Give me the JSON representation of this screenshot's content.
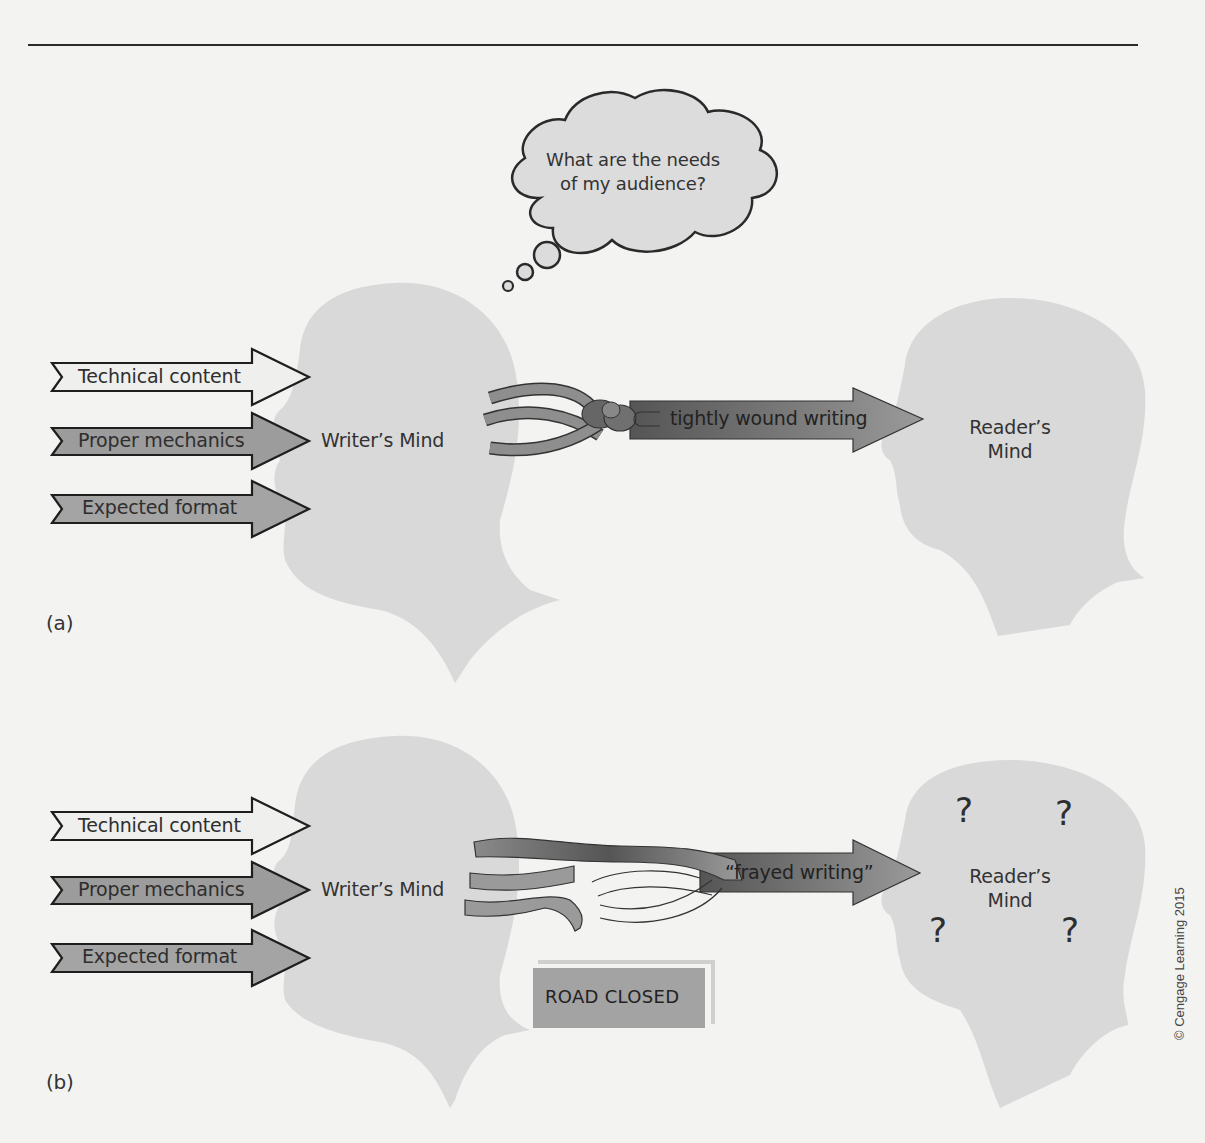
{
  "figure": {
    "thought_bubble": {
      "line1": "What are the needs",
      "line2": "of my audience?"
    },
    "panel_a": {
      "letter": "(a)",
      "inputs": [
        {
          "label": "Technical content",
          "fill": "#efefed"
        },
        {
          "label": "Proper mechanics",
          "fill": "#9c9c9c"
        },
        {
          "label": "Expected format",
          "fill": "#a4a4a4"
        }
      ],
      "writer_label": "Writer’s Mind",
      "output_arrow_label": "tightly wound writing",
      "reader_label_line1": "Reader’s",
      "reader_label_line2": "Mind"
    },
    "panel_b": {
      "letter": "(b)",
      "inputs": [
        {
          "label": "Technical content",
          "fill": "#efefed"
        },
        {
          "label": "Proper mechanics",
          "fill": "#9c9c9c"
        },
        {
          "label": "Expected format",
          "fill": "#a4a4a4"
        }
      ],
      "writer_label": "Writer’s Mind",
      "output_arrow_label": "“frayed writing”",
      "reader_label_line1": "Reader’s",
      "reader_label_line2": "Mind",
      "question_marks": [
        "?",
        "?",
        "?",
        "?"
      ],
      "road_sign": "ROAD CLOSED"
    },
    "copyright": "© Cengage Learning 2015",
    "colors": {
      "background": "#f3f3f1",
      "head_silhouette": "#d9d9d9",
      "arrow_dark": "#6e6e6e",
      "strand": "#9a9a9a",
      "road_sign": "#a3a3a3"
    }
  }
}
